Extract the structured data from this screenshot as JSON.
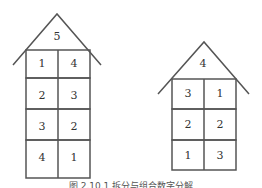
{
  "houses": [
    {
      "name": "left-house",
      "roof": "5",
      "rows": [
        [
          "1",
          "4"
        ],
        [
          "2",
          "3"
        ],
        [
          "3",
          "2"
        ],
        [
          "4",
          "1"
        ]
      ]
    },
    {
      "name": "right-house",
      "roof": "4",
      "rows": [
        [
          "3",
          "1"
        ],
        [
          "2",
          "2"
        ],
        [
          "1",
          "3"
        ]
      ]
    }
  ],
  "caption": "图 2.10.1 拆分与组合数字分解"
}
